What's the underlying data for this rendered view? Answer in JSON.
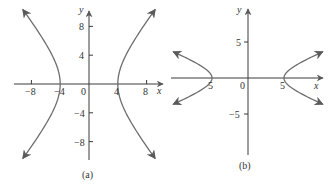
{
  "colors": {
    "axis": "#3a3a3a",
    "curve": "#6e6e6e",
    "text": "#333333",
    "background": "#ffffff"
  },
  "chart_data": [
    {
      "type": "line",
      "title": "",
      "caption": "(a)",
      "equation": "x^2/16 - y^2/25 = 1",
      "xlabel": "x",
      "ylabel": "y",
      "xlim": [
        -10,
        10
      ],
      "ylim": [
        -11,
        11
      ],
      "grid": false,
      "legend": "none",
      "x_ticks": [
        -8,
        -4,
        4,
        8
      ],
      "x_tick_labels": [
        "−8",
        "−4",
        "4",
        "8"
      ],
      "y_ticks": [
        8,
        4,
        -4,
        -8
      ],
      "y_tick_labels": [
        "8",
        "4",
        "−4",
        "−8"
      ],
      "origin_label": "0",
      "series": [
        {
          "name": "right branch",
          "a": 4,
          "b": 5,
          "orientation": "horizontal",
          "side": 1,
          "x_extent": 9.2
        },
        {
          "name": "left branch",
          "a": 4,
          "b": 5,
          "orientation": "horizontal",
          "side": -1,
          "x_extent": 9.2
        }
      ],
      "vertices": [
        [
          -4,
          0
        ],
        [
          4,
          0
        ]
      ]
    },
    {
      "type": "line",
      "title": "",
      "caption": "(b)",
      "equation": "x^2/25 - y^2/4 = 1",
      "xlabel": "x",
      "ylabel": "y",
      "xlim": [
        -11,
        11
      ],
      "ylim": [
        -10,
        10
      ],
      "grid": false,
      "legend": "none",
      "x_ticks": [
        -5,
        5
      ],
      "x_tick_labels": [
        "5",
        "5"
      ],
      "y_ticks": [
        5,
        -5
      ],
      "y_tick_labels": [
        "5",
        "−5"
      ],
      "origin_label": "0",
      "series": [
        {
          "name": "right branch",
          "a": 5,
          "b": 2,
          "orientation": "horizontal",
          "side": 1,
          "x_extent": 10.4
        },
        {
          "name": "left branch",
          "a": 5,
          "b": 2,
          "orientation": "horizontal",
          "side": -1,
          "x_extent": 10.4
        }
      ],
      "vertices": [
        [
          -5,
          0
        ],
        [
          5,
          0
        ]
      ]
    }
  ],
  "labels": {
    "a": {
      "x": "x",
      "y": "y",
      "origin": "0",
      "caption": "(a)",
      "xt": [
        "−8",
        "−4",
        "4",
        "8"
      ],
      "yt": [
        "8",
        "4",
        "−4",
        "−8"
      ]
    },
    "b": {
      "x": "x",
      "y": "y",
      "origin": "0",
      "caption": "(b)",
      "xt": [
        "5",
        "5"
      ],
      "yt": [
        "5",
        "−5"
      ]
    }
  }
}
